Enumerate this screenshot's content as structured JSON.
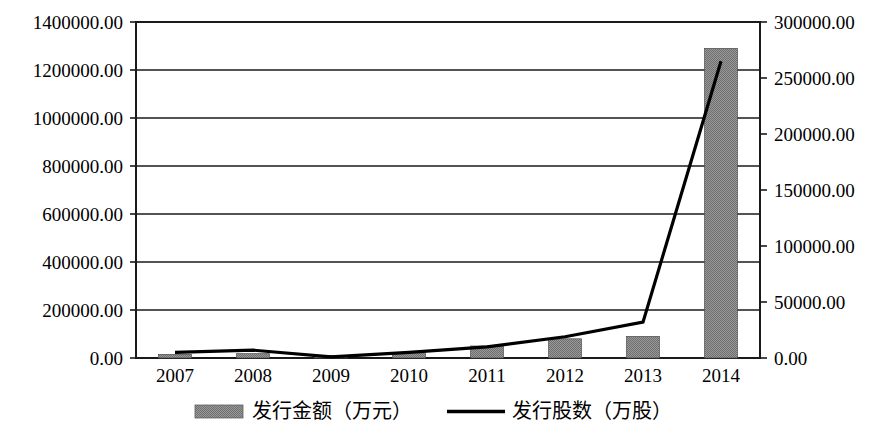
{
  "chart_data": {
    "type": "bar",
    "title": "",
    "subtitle": "",
    "xlabel": "",
    "ylabel": "",
    "categories": [
      "2007",
      "2008",
      "2009",
      "2010",
      "2011",
      "2012",
      "2013",
      "2014"
    ],
    "grid": true,
    "legend_position": "bottom",
    "axes": {
      "left": {
        "label": "",
        "min": 0,
        "max": 1400000,
        "step": 200000,
        "ticks": [
          "0.00",
          "200000.00",
          "400000.00",
          "600000.00",
          "800000.00",
          "1000000.00",
          "1200000.00",
          "1400000.00"
        ]
      },
      "right": {
        "label": "",
        "min": 0,
        "max": 300000,
        "step": 50000,
        "ticks": [
          "0.00",
          "50000.00",
          "100000.00",
          "150000.00",
          "200000.00",
          "250000.00",
          "300000.00"
        ]
      }
    },
    "series": [
      {
        "name": "发行金额（万元）",
        "kind": "bar",
        "axis": "left",
        "color": "#8c8c8c",
        "values": [
          15000,
          18000,
          10000,
          22000,
          50000,
          80000,
          90000,
          1290000
        ]
      },
      {
        "name": "发行股数（万股）",
        "kind": "line",
        "axis": "right",
        "color": "#000000",
        "values": [
          5000,
          7000,
          1000,
          5000,
          10000,
          19000,
          32000,
          265000
        ]
      }
    ]
  },
  "legend": {
    "items": [
      {
        "label": "发行金额（万元）",
        "marker": "bar-swatch",
        "color": "#8c8c8c"
      },
      {
        "label": "发行股数（万股）",
        "marker": "line-swatch",
        "color": "#000000"
      }
    ]
  },
  "colors": {
    "bar_fill": "#8c8c8c",
    "line_stroke": "#000000",
    "axis_stroke": "#1a1a1a",
    "background": "#ffffff"
  }
}
